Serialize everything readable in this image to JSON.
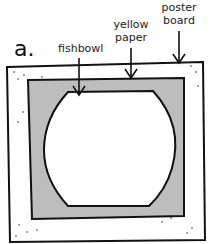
{
  "figure": {
    "panel_letter": "a.",
    "labels": {
      "fishbowl": "fishbowl",
      "yellow_paper_line1": "yellow",
      "yellow_paper_line2": "paper",
      "poster_board_line1": "poster",
      "poster_board_line2": "board"
    },
    "colors": {
      "poster_board": "#ffffff",
      "yellow_paper": "#bdbdbd",
      "fishbowl": "#ffffff",
      "outline": "#111111"
    }
  }
}
